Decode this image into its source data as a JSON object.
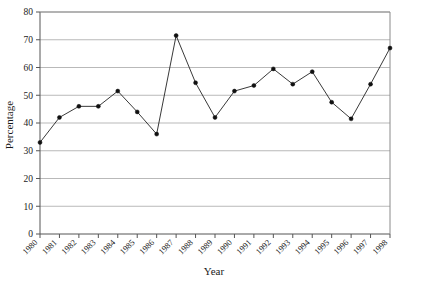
{
  "chart_data": {
    "type": "line",
    "title": "",
    "xlabel": "Year",
    "ylabel": "Percentage",
    "categories": [
      "1980",
      "1981",
      "1982",
      "1983",
      "1984",
      "1985",
      "1986",
      "1987",
      "1988",
      "1989",
      "1990",
      "1991",
      "1992",
      "1993",
      "1994",
      "1995",
      "1996",
      "1997",
      "1998"
    ],
    "values": [
      33,
      42,
      46,
      46,
      51.5,
      44,
      36,
      71.5,
      54.5,
      42,
      51.5,
      53.5,
      59.5,
      54,
      58.5,
      47.5,
      41.5,
      54,
      67
    ],
    "series": [
      {
        "name": "Percentage",
        "values": [
          33,
          42,
          46,
          46,
          51.5,
          44,
          36,
          71.5,
          54.5,
          42,
          51.5,
          53.5,
          59.5,
          54,
          58.5,
          47.5,
          41.5,
          54,
          67
        ]
      }
    ],
    "ylim": [
      0,
      80
    ],
    "ytick_labels": [
      "0",
      "10",
      "20",
      "30",
      "40",
      "50",
      "60",
      "70",
      "80"
    ],
    "ytick_values": [
      0,
      10,
      20,
      30,
      40,
      50,
      60,
      70,
      80
    ],
    "grid": "horizontal",
    "legend": "none",
    "marker": "filled-circle",
    "line_color": "#222222",
    "grid_color": "#b9b9b9",
    "axis_color": "#555555",
    "background_color": "#ffffff",
    "xtick_rotation": -45
  }
}
